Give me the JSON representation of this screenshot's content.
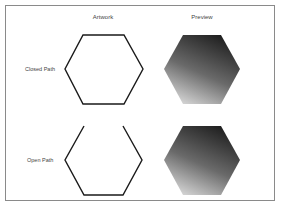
{
  "columns": {
    "artwork": "Artwork",
    "preview": "Preview"
  },
  "rows": [
    {
      "label": "Closed Path",
      "type": "closed"
    },
    {
      "label": "Open Path",
      "type": "open"
    }
  ],
  "colors": {
    "stroke": "#1a1a1a",
    "border": "#8a8a8a",
    "gradient_dark": "#1e1e1e",
    "gradient_light": "#d4d4d4"
  }
}
